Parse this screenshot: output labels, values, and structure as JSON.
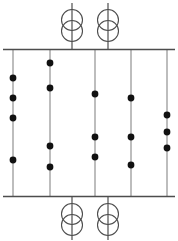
{
  "diagram": {
    "type": "single-line-diagram",
    "canvas": {
      "width": 178,
      "height": 241
    },
    "colors": {
      "background": "#ffffff",
      "busbar": "#4d4d4d",
      "feeder": "#9a9a9a",
      "transformer": "#4d4d4d",
      "node": "#111111"
    },
    "busbars": [
      {
        "name": "top-busbar",
        "y": 49.5,
        "x1": 3,
        "x2": 175
      },
      {
        "name": "bottom-busbar",
        "y": 196.5,
        "x1": 3,
        "x2": 175
      }
    ],
    "feeders": [
      {
        "name": "feeder-1",
        "x": 13,
        "y1": 49.5,
        "y2": 196.5
      },
      {
        "name": "feeder-2",
        "x": 50,
        "y1": 49.5,
        "y2": 196.5
      },
      {
        "name": "feeder-3",
        "x": 95,
        "y1": 49.5,
        "y2": 196.5
      },
      {
        "name": "feeder-4",
        "x": 131,
        "y1": 49.5,
        "y2": 196.5
      },
      {
        "name": "feeder-5",
        "x": 167,
        "y1": 49.5,
        "y2": 196.5
      }
    ],
    "nodes": [
      {
        "name": "node-f1-a",
        "x": 13,
        "y": 78,
        "r": 3.4
      },
      {
        "name": "node-f1-b",
        "x": 13,
        "y": 98,
        "r": 3.4
      },
      {
        "name": "node-f1-c",
        "x": 13,
        "y": 118,
        "r": 3.4
      },
      {
        "name": "node-f1-d",
        "x": 13,
        "y": 160,
        "r": 3.4
      },
      {
        "name": "node-f2-a",
        "x": 50,
        "y": 63,
        "r": 3.4
      },
      {
        "name": "node-f2-b",
        "x": 50,
        "y": 88,
        "r": 3.4
      },
      {
        "name": "node-f2-c",
        "x": 50,
        "y": 146,
        "r": 3.4
      },
      {
        "name": "node-f2-d",
        "x": 50,
        "y": 167,
        "r": 3.4
      },
      {
        "name": "node-f3-a",
        "x": 95,
        "y": 94,
        "r": 3.4
      },
      {
        "name": "node-f3-b",
        "x": 95,
        "y": 137,
        "r": 3.4
      },
      {
        "name": "node-f3-c",
        "x": 95,
        "y": 157,
        "r": 3.4
      },
      {
        "name": "node-f4-a",
        "x": 131,
        "y": 98,
        "r": 3.4
      },
      {
        "name": "node-f4-b",
        "x": 131,
        "y": 137,
        "r": 3.4
      },
      {
        "name": "node-f4-c",
        "x": 131,
        "y": 165,
        "r": 3.4
      },
      {
        "name": "node-f5-a",
        "x": 167,
        "y": 115,
        "r": 3.4
      },
      {
        "name": "node-f5-b",
        "x": 167,
        "y": 132,
        "r": 3.4
      },
      {
        "name": "node-f5-c",
        "x": 167,
        "y": 148,
        "r": 3.4
      }
    ],
    "transformers": [
      {
        "name": "transformer-top-left",
        "x": 72,
        "coil_upper_cy": 20,
        "coil_lower_cy": 31,
        "coil_r": 10.5,
        "lead_top_y": 3,
        "lead_bottom_y": 49.5
      },
      {
        "name": "transformer-top-right",
        "x": 108,
        "coil_upper_cy": 20,
        "coil_lower_cy": 31,
        "coil_r": 10.5,
        "lead_top_y": 3,
        "lead_bottom_y": 49.5
      },
      {
        "name": "transformer-bottom-left",
        "x": 72,
        "coil_upper_cy": 214,
        "coil_lower_cy": 225,
        "coil_r": 10.5,
        "lead_top_y": 196.5,
        "lead_bottom_y": 240
      },
      {
        "name": "transformer-bottom-right",
        "x": 108,
        "coil_upper_cy": 214,
        "coil_lower_cy": 225,
        "coil_r": 10.5,
        "lead_top_y": 196.5,
        "lead_bottom_y": 240
      }
    ]
  }
}
